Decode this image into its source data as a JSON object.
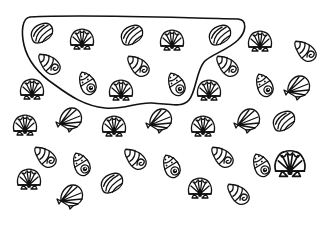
{
  "figure": {
    "description": "Line drawing of seashells scattered on a white page, with a hand-drawn closed loop enclosing a group of shells in the upper-left.",
    "stroke_color": "#111111",
    "background_color": "#ffffff"
  },
  "loop": {
    "label": "encircled-group",
    "path": "M 30 17 C 90 14, 180 18, 238 19 C 248 20, 246 32, 238 40 C 228 50, 210 55, 204 62 C 196 72, 196 92, 189 100 C 182 108, 170 104, 152 103 C 135 102, 125 110, 105 108 C 85 106, 70 96, 55 85 C 40 75, 28 62, 24 45 C 21 32, 22 18, 30 17 Z"
  },
  "shells": [
    {
      "type": "clam",
      "x": 42,
      "y": 33,
      "rot": -15,
      "in_loop": true
    },
    {
      "type": "scallop",
      "x": 82,
      "y": 41,
      "rot": 0,
      "in_loop": true
    },
    {
      "type": "clam",
      "x": 132,
      "y": 35,
      "rot": -15,
      "in_loop": true
    },
    {
      "type": "scallop",
      "x": 172,
      "y": 42,
      "rot": 0,
      "in_loop": true
    },
    {
      "type": "clam",
      "x": 220,
      "y": 35,
      "rot": -15,
      "in_loop": true
    },
    {
      "type": "snail",
      "x": 49,
      "y": 64,
      "rot": 20,
      "in_loop": true
    },
    {
      "type": "snail",
      "x": 138,
      "y": 66,
      "rot": 20,
      "in_loop": true
    },
    {
      "type": "snail-upright",
      "x": 87,
      "y": 83,
      "rot": -20,
      "in_loop": true
    },
    {
      "type": "scallop",
      "x": 121,
      "y": 92,
      "rot": 0,
      "in_loop": true
    },
    {
      "type": "snail-upright",
      "x": 176,
      "y": 84,
      "rot": -20,
      "in_loop": true
    },
    {
      "type": "scallop",
      "x": 260,
      "y": 43,
      "rot": 0,
      "in_loop": false
    },
    {
      "type": "snail",
      "x": 305,
      "y": 51,
      "rot": 20,
      "in_loop": false
    },
    {
      "type": "snail",
      "x": 227,
      "y": 66,
      "rot": 20,
      "in_loop": false
    },
    {
      "type": "snail-upright",
      "x": 264,
      "y": 85,
      "rot": -20,
      "in_loop": false
    },
    {
      "type": "fan",
      "x": 297,
      "y": 87,
      "rot": 0,
      "in_loop": false
    },
    {
      "type": "scallop",
      "x": 32,
      "y": 91,
      "rot": 0,
      "in_loop": false
    },
    {
      "type": "scallop",
      "x": 209,
      "y": 92,
      "rot": 0,
      "in_loop": false
    },
    {
      "type": "scallop",
      "x": 25,
      "y": 127,
      "rot": 0,
      "in_loop": false
    },
    {
      "type": "fan",
      "x": 69,
      "y": 119,
      "rot": 0,
      "in_loop": false
    },
    {
      "type": "scallop",
      "x": 114,
      "y": 128,
      "rot": 0,
      "in_loop": false
    },
    {
      "type": "fan",
      "x": 159,
      "y": 120,
      "rot": 0,
      "in_loop": false
    },
    {
      "type": "scallop",
      "x": 203,
      "y": 128,
      "rot": 0,
      "in_loop": false
    },
    {
      "type": "fan",
      "x": 247,
      "y": 120,
      "rot": 0,
      "in_loop": false
    },
    {
      "type": "clam",
      "x": 284,
      "y": 121,
      "rot": -15,
      "in_loop": false
    },
    {
      "type": "snail",
      "x": 45,
      "y": 157,
      "rot": 20,
      "in_loop": false
    },
    {
      "type": "snail-upright",
      "x": 81,
      "y": 164,
      "rot": -20,
      "in_loop": false
    },
    {
      "type": "snail",
      "x": 135,
      "y": 159,
      "rot": 20,
      "in_loop": false
    },
    {
      "type": "snail-upright",
      "x": 171,
      "y": 166,
      "rot": -20,
      "in_loop": false
    },
    {
      "type": "snail",
      "x": 222,
      "y": 157,
      "rot": 20,
      "in_loop": false
    },
    {
      "type": "snail-upright",
      "x": 261,
      "y": 165,
      "rot": -20,
      "in_loop": false
    },
    {
      "type": "scallop-large",
      "x": 290,
      "y": 166,
      "rot": 0,
      "in_loop": false
    },
    {
      "type": "scallop",
      "x": 29,
      "y": 181,
      "rot": 0,
      "in_loop": false
    },
    {
      "type": "fan",
      "x": 70,
      "y": 196,
      "rot": 0,
      "in_loop": false
    },
    {
      "type": "clam",
      "x": 112,
      "y": 183,
      "rot": -15,
      "in_loop": false
    },
    {
      "type": "scallop",
      "x": 200,
      "y": 190,
      "rot": 0,
      "in_loop": false
    },
    {
      "type": "snail",
      "x": 238,
      "y": 194,
      "rot": 20,
      "in_loop": false
    }
  ],
  "counts": {
    "total": 36,
    "inside_loop": 10,
    "outside_loop": 26
  }
}
